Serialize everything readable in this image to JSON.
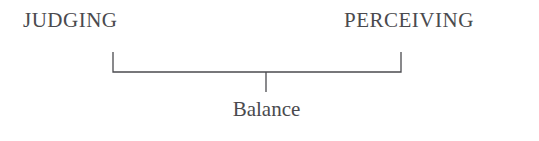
{
  "diagram": {
    "type": "continuum-bracket",
    "poles": [
      {
        "id": "judging",
        "label": "JUDGING",
        "side": "left"
      },
      {
        "id": "perceiving",
        "label": "PERCEIVING",
        "side": "right"
      }
    ],
    "center": {
      "id": "balance",
      "label": "Balance"
    },
    "colors": {
      "background": "#ffffff",
      "text": "#4a4a4e",
      "rule": "#4b4b4f"
    },
    "geometry": {
      "bracket_left_x": 113,
      "bracket_right_x": 401,
      "bracket_rule_y": 72,
      "bracket_tick_top_y": 52,
      "stem_x": 266,
      "stem_bottom_y": 92
    }
  }
}
